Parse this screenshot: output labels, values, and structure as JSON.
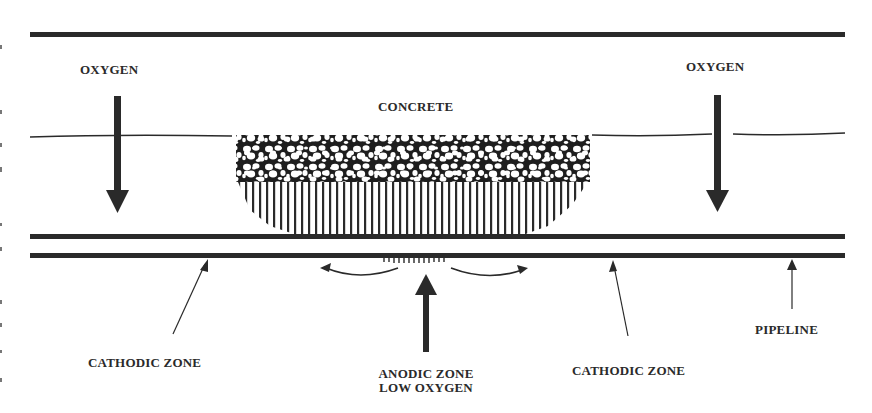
{
  "diagram": {
    "labels": {
      "oxygen_left": "OXYGEN",
      "oxygen_right": "OXYGEN",
      "concrete": "CONCRETE",
      "cathodic_zone_left": "CATHODIC ZONE",
      "cathodic_zone_right": "CATHODIC ZONE",
      "anodic_zone_line1": "ANODIC ZONE",
      "anodic_zone_line2": "LOW OXYGEN",
      "pipeline": "PIPELINE"
    },
    "colors": {
      "ink": "#2a2a2a",
      "background": "#ffffff"
    },
    "elements": [
      {
        "name": "top-boundary-line",
        "type": "thick-line"
      },
      {
        "name": "ground-surface-line",
        "type": "thin-line"
      },
      {
        "name": "concrete-block",
        "type": "aggregate-fill"
      },
      {
        "name": "pipeline-top-wall",
        "type": "thick-line"
      },
      {
        "name": "pipeline-bottom-wall",
        "type": "thick-line"
      },
      {
        "name": "oxygen-arrow-left",
        "direction": "down"
      },
      {
        "name": "oxygen-arrow-right",
        "direction": "down"
      },
      {
        "name": "anodic-arrow",
        "direction": "up"
      },
      {
        "name": "current-flow-arrow-left",
        "direction": "left"
      },
      {
        "name": "current-flow-arrow-right",
        "direction": "right"
      },
      {
        "name": "cathodic-pointer-left",
        "direction": "up-right"
      },
      {
        "name": "cathodic-pointer-right",
        "direction": "up-left"
      },
      {
        "name": "pipeline-pointer",
        "direction": "up"
      }
    ]
  }
}
